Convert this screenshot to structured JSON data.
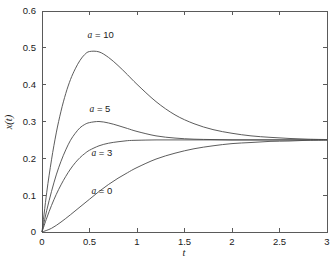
{
  "chart_data": {
    "type": "line",
    "title": "",
    "xlabel": "t",
    "ylabel": "x(t)",
    "xlim": [
      0,
      3
    ],
    "ylim": [
      0,
      0.6
    ],
    "grid": false,
    "legend_position": "inline-annotations",
    "xticks": [
      "0",
      "0.5",
      "1",
      "1.5",
      "2",
      "2.5",
      "3"
    ],
    "xtick_values": [
      0,
      0.5,
      1,
      1.5,
      2,
      2.5,
      3
    ],
    "yticks": [
      "0",
      "0.1",
      "0.2",
      "0.3",
      "0.4",
      "0.5",
      "0.6"
    ],
    "ytick_values": [
      0,
      0.1,
      0.2,
      0.3,
      0.4,
      0.5,
      0.6
    ],
    "steady_state": 0.25,
    "line_color": "#4a4a4a",
    "axis_color": "#5a5a5a",
    "background_color": "#ffffff",
    "series": [
      {
        "name": "a = 10",
        "label_var": "a",
        "label_rest": " = 10",
        "a": 10,
        "peak": {
          "t": 0.45,
          "x": 0.49
        },
        "x": [
          0,
          0.05,
          0.1,
          0.15,
          0.2,
          0.25,
          0.3,
          0.35,
          0.4,
          0.45,
          0.5,
          0.6,
          0.7,
          0.8,
          0.9,
          1.0,
          1.2,
          1.4,
          1.6,
          1.8,
          2.0,
          2.2,
          2.4,
          2.6,
          2.8,
          3.0
        ],
        "values": [
          0,
          0.108,
          0.196,
          0.269,
          0.328,
          0.376,
          0.414,
          0.443,
          0.466,
          0.482,
          0.49,
          0.489,
          0.474,
          0.452,
          0.427,
          0.401,
          0.354,
          0.318,
          0.294,
          0.278,
          0.268,
          0.261,
          0.257,
          0.254,
          0.252,
          0.251
        ]
      },
      {
        "name": "a = 5",
        "label_var": "a",
        "label_rest": " = 5",
        "a": 5,
        "peak": {
          "t": 0.64,
          "x": 0.3
        },
        "x": [
          0,
          0.05,
          0.1,
          0.15,
          0.2,
          0.25,
          0.3,
          0.35,
          0.4,
          0.45,
          0.5,
          0.6,
          0.7,
          0.8,
          0.9,
          1.0,
          1.2,
          1.4,
          1.6,
          1.8,
          2.0,
          2.2,
          2.4,
          2.6,
          2.8,
          3.0
        ],
        "values": [
          0,
          0.059,
          0.11,
          0.155,
          0.192,
          0.223,
          0.249,
          0.268,
          0.283,
          0.292,
          0.297,
          0.3,
          0.296,
          0.289,
          0.281,
          0.273,
          0.261,
          0.255,
          0.252,
          0.251,
          0.25,
          0.25,
          0.25,
          0.25,
          0.25,
          0.25
        ]
      },
      {
        "name": "a = 3",
        "label_var": "a",
        "label_rest": " = 3",
        "a": 3,
        "peak": {
          "t": 3.0,
          "x": 0.25
        },
        "x": [
          0,
          0.05,
          0.1,
          0.15,
          0.2,
          0.25,
          0.3,
          0.35,
          0.4,
          0.45,
          0.5,
          0.6,
          0.7,
          0.8,
          0.9,
          1.0,
          1.2,
          1.4,
          1.6,
          1.8,
          2.0,
          2.2,
          2.4,
          2.6,
          2.8,
          3.0
        ],
        "values": [
          0,
          0.038,
          0.072,
          0.102,
          0.128,
          0.151,
          0.171,
          0.188,
          0.202,
          0.213,
          0.222,
          0.234,
          0.241,
          0.245,
          0.248,
          0.249,
          0.25,
          0.25,
          0.25,
          0.25,
          0.25,
          0.25,
          0.25,
          0.25,
          0.25,
          0.25
        ]
      },
      {
        "name": "a = 0",
        "label_var": "a",
        "label_rest": " = 0",
        "a": 0,
        "peak": {
          "t": 3.0,
          "x": 0.25
        },
        "x": [
          0,
          0.1,
          0.2,
          0.3,
          0.4,
          0.5,
          0.6,
          0.7,
          0.8,
          0.9,
          1.0,
          1.2,
          1.4,
          1.6,
          1.8,
          2.0,
          2.2,
          2.4,
          2.6,
          2.8,
          3.0
        ],
        "values": [
          0,
          0.01,
          0.027,
          0.047,
          0.068,
          0.089,
          0.11,
          0.129,
          0.146,
          0.161,
          0.175,
          0.198,
          0.214,
          0.226,
          0.234,
          0.24,
          0.243,
          0.246,
          0.247,
          0.249,
          0.25
        ]
      }
    ],
    "annotations": [
      {
        "text": "a = 10",
        "t": 0.48,
        "x": 0.535
      },
      {
        "text": "a = 5",
        "t": 0.5,
        "x": 0.335
      },
      {
        "text": "a = 3",
        "t": 0.52,
        "x": 0.215
      },
      {
        "text": "a = 0",
        "t": 0.52,
        "x": 0.112
      }
    ]
  }
}
